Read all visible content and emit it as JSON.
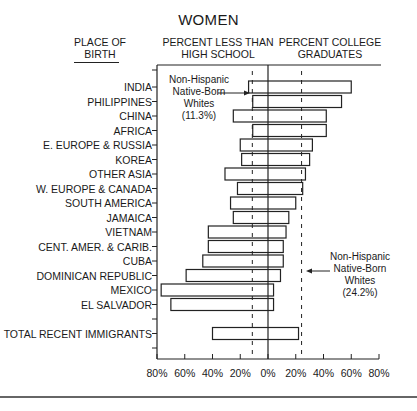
{
  "chart_data": {
    "type": "bar",
    "subtype": "diverging-horizontal-bar",
    "title": "WOMEN",
    "category_header": "PLACE OF BIRTH",
    "categories": [
      "INDIA",
      "PHILIPPINES",
      "CHINA",
      "AFRICA",
      "E. EUROPE & RUSSIA",
      "KOREA",
      "OTHER ASIA",
      "W. EUROPE & CANADA",
      "SOUTH AMERICA",
      "JAMAICA",
      "VIETNAM",
      "CENT. AMER. & CARIB.",
      "CUBA",
      "DOMINICAN REPUBLIC",
      "MEXICO",
      "EL SALVADOR",
      "TOTAL RECENT IMMIGRANTS"
    ],
    "series": [
      {
        "name": "PERCENT LESS THAN HIGH SCHOOL",
        "direction": "left",
        "values": [
          14,
          11,
          25,
          11,
          20,
          19,
          31,
          22,
          27,
          25,
          43,
          43,
          47,
          59,
          77,
          70,
          40
        ]
      },
      {
        "name": "PERCENT COLLEGE GRADUATES",
        "direction": "right",
        "values": [
          60,
          53,
          42,
          42,
          32,
          30,
          27,
          25,
          20,
          15,
          13,
          11,
          11,
          9,
          4,
          4,
          22
        ]
      }
    ],
    "reference_lines": [
      {
        "side": "left",
        "value": 11.3,
        "label": "Non-Hispanic Native-Born Whites (11.3%)"
      },
      {
        "side": "right",
        "value": 24.2,
        "label": "Non-Hispanic Native-Born Whites (24.2%)"
      }
    ],
    "xticks": [
      "80%",
      "60%",
      "40%",
      "20%",
      "0%",
      "20%",
      "40%",
      "60%",
      "80%"
    ],
    "xlim": [
      -80,
      80
    ],
    "xlabel": "",
    "ylabel": "",
    "grid": false,
    "legend": "none"
  },
  "title": "WOMEN",
  "headers": {
    "birth_line1": "PLACE OF",
    "birth_line2": "BIRTH",
    "less_line1": "PERCENT LESS THAN",
    "less_line2": "HIGH SCHOOL",
    "coll_line1": "PERCENT COLLEGE",
    "coll_line2": "GRADUATES"
  },
  "notes": {
    "left": [
      "Non-Hispanic",
      "Native-Born",
      "Whites",
      "(11.3%)"
    ],
    "right": [
      "Non-Hispanic",
      "Native-Born",
      "Whites",
      "(24.2%)"
    ]
  }
}
